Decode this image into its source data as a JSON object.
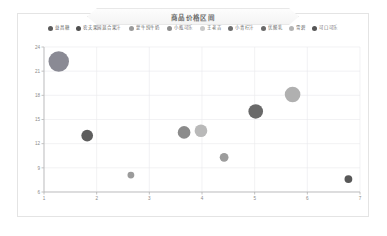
{
  "card": {
    "title": "商品价格区间"
  },
  "legend": {
    "position": "top",
    "items": [
      {
        "label": "益昌糖",
        "color": "#5b5b5b"
      },
      {
        "label": "农夫果园混合果汁",
        "color": "#4f4f4f"
      },
      {
        "label": "蒙牛纯牛奶",
        "color": "#9a9a9a"
      },
      {
        "label": "小瓶可乐",
        "color": "#8e8e8e"
      },
      {
        "label": "王老吉",
        "color": "#c9c9c9"
      },
      {
        "label": "小青柠汁",
        "color": "#6e6e6e"
      },
      {
        "label": "优酸乳",
        "color": "#6a6a6a"
      },
      {
        "label": "雪碧",
        "color": "#b4b4b4"
      },
      {
        "label": "可口可乐",
        "color": "#565656"
      }
    ]
  },
  "chart_data": {
    "type": "scatter",
    "title": "商品价格区间",
    "xlabel": "",
    "ylabel": "",
    "xlim": [
      1,
      7
    ],
    "ylim": [
      6,
      24
    ],
    "xticks": [
      "1",
      "2",
      "3",
      "4",
      "5",
      "6",
      "7"
    ],
    "yticks": [
      "6",
      "9",
      "12",
      "15",
      "18",
      "21",
      "24"
    ],
    "grid": true,
    "points": [
      {
        "name": "益昌糖",
        "x": 1.28,
        "y": 22.2,
        "size": 21,
        "color": "#8a8a94"
      },
      {
        "name": "农夫果园混合果汁",
        "x": 1.82,
        "y": 13.0,
        "size": 12,
        "color": "#5e5e5e"
      },
      {
        "name": "蒙牛纯牛奶",
        "x": 2.65,
        "y": 8.1,
        "size": 7,
        "color": "#9b9b9b"
      },
      {
        "name": "小瓶可乐",
        "x": 3.66,
        "y": 13.4,
        "size": 13,
        "color": "#8b8b8b"
      },
      {
        "name": "王老吉",
        "x": 3.98,
        "y": 13.6,
        "size": 13,
        "color": "#b9b9b9"
      },
      {
        "name": "小青柠汁",
        "x": 4.42,
        "y": 10.3,
        "size": 9,
        "color": "#9c9c9c"
      },
      {
        "name": "优酸乳",
        "x": 5.02,
        "y": 16.0,
        "size": 15,
        "color": "#696969"
      },
      {
        "name": "雪碧",
        "x": 5.72,
        "y": 18.1,
        "size": 16,
        "color": "#b0b0b0"
      },
      {
        "name": "可口可乐",
        "x": 6.78,
        "y": 7.6,
        "size": 8,
        "color": "#585858"
      }
    ]
  },
  "colors": {
    "card_border": "#e4e4e4",
    "grid": "#e9e9ec",
    "axis": "#a9a9a9",
    "tick_text": "#8a8a8a"
  }
}
